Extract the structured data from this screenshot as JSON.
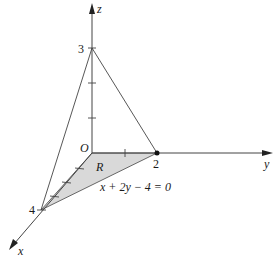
{
  "diagram": {
    "axes": {
      "x_label": "x",
      "y_label": "y",
      "z_label": "z",
      "origin_label": "O"
    },
    "intercepts": {
      "x_value": "4",
      "y_value": "2",
      "z_value": "3"
    },
    "region_label": "R",
    "line_equation": "x + 2y − 4 = 0",
    "colors": {
      "line": "#333333",
      "region_fill": "#d9d9d9"
    }
  }
}
